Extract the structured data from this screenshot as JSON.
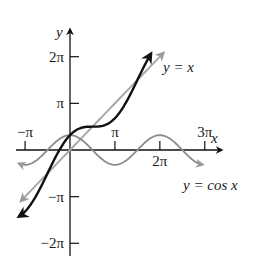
{
  "chart_data": {
    "type": "line",
    "title": "",
    "xlabel": "x",
    "ylabel": "y",
    "origin_px": [
      70,
      150
    ],
    "scale_px_per_unit": {
      "x": 14.3,
      "y": 14.85
    },
    "x_axis": {
      "from_px": 16,
      "to_px": 222
    },
    "y_axis": {
      "from_px": 256,
      "to_px": 29
    },
    "x_ticks": [
      {
        "value": -3.14159,
        "label": "−π",
        "label_pos": "above"
      },
      {
        "value": 3.14159,
        "label": "π",
        "label_pos": "above"
      },
      {
        "value": 6.28319,
        "label": "2π",
        "label_pos": "below"
      },
      {
        "value": 9.42478,
        "label": "3π",
        "label_pos": "above"
      }
    ],
    "y_ticks": [
      {
        "value": 6.28319,
        "label": "2π"
      },
      {
        "value": 3.14159,
        "label": "π"
      },
      {
        "value": -3.14159,
        "label": "−π"
      },
      {
        "value": -6.28319,
        "label": "−2π"
      }
    ],
    "series": [
      {
        "name": "y = x",
        "fn": "x",
        "x_range": [
          -3.45,
          6.55
        ],
        "color": "#a8a8a8",
        "width": 2,
        "points": [
          [
            -3,
            -3
          ],
          [
            0,
            0
          ],
          [
            3,
            3
          ],
          [
            6,
            6
          ]
        ]
      },
      {
        "name": "y = cos x",
        "fn": "cos",
        "x_range": [
          -3.6,
          9.3
        ],
        "color": "#8c8c8c",
        "width": 1.8,
        "points": [
          [
            -3.14,
            -1
          ],
          [
            -1.57,
            0
          ],
          [
            0,
            1
          ],
          [
            1.57,
            0
          ],
          [
            3.14,
            -1
          ],
          [
            4.71,
            0
          ],
          [
            6.28,
            1
          ],
          [
            7.85,
            0
          ],
          [
            9.42,
            -1
          ]
        ]
      },
      {
        "name": "y = x + cos x",
        "fn": "x+cos",
        "x_range": [
          -3.6,
          5.68
        ],
        "color": "#111111",
        "width": 2.4,
        "points": [
          [
            -3.14,
            -4.14
          ],
          [
            0,
            1
          ],
          [
            1.57,
            1.57
          ],
          [
            3.14,
            2.14
          ],
          [
            4.71,
            4.71
          ]
        ]
      }
    ],
    "annotations": [
      {
        "text": "y = x",
        "x_px": 163,
        "y_px": 72
      },
      {
        "text": "y = cos x",
        "x_px": 183,
        "y_px": 189
      }
    ],
    "grid": false,
    "legend": null
  },
  "labels": {
    "y_axis": "y",
    "x_axis": "x",
    "line_label": "y = x",
    "cos_label": "y = cos x"
  }
}
